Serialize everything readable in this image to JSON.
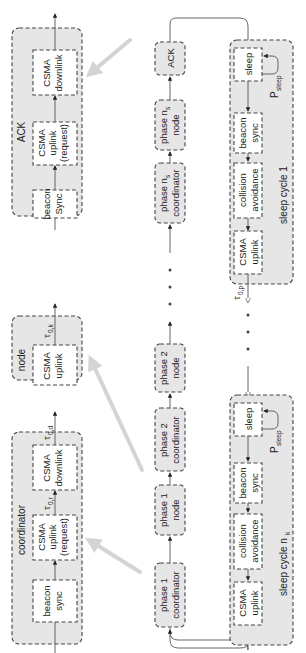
{
  "figure": {
    "orientation": "rotated 90 degrees counter-clockwise",
    "left_column": {
      "ack_detail": {
        "title": "ACK",
        "boxes": [
          {
            "line1": "beacon",
            "line2": "Sync",
            "line3": ""
          },
          {
            "line1": "CSMA",
            "line2": "uplink",
            "line3": "(request)"
          },
          {
            "line1": "CSMA",
            "line2": "downlink",
            "line3": ""
          }
        ]
      },
      "node_detail": {
        "title": "node",
        "boxes": [
          {
            "line1": "CSMA",
            "line2": "uplink"
          }
        ],
        "tau_label": "τ",
        "tau_sub": "0,k"
      },
      "coordinator_detail": {
        "title": "coordinator",
        "boxes": [
          {
            "line1": "beacon",
            "line2": "sync",
            "line3": ""
          },
          {
            "line1": "CSMA",
            "line2": "uplink",
            "line3": "(request)"
          },
          {
            "line1": "CSMA",
            "line2": "downlink",
            "line3": ""
          }
        ],
        "tau_r": "τ",
        "tau_r_sub": "0,r",
        "tau_d": "τ",
        "tau_d_sub": "0,d"
      }
    },
    "middle_column": {
      "phases": [
        {
          "line1": "phase 1",
          "line2": "coordinator"
        },
        {
          "line1": "phase 1",
          "line2": "node"
        },
        {
          "line1": "phase 2",
          "line2": "coordinator"
        },
        {
          "line1": "phase 2",
          "line2": "node"
        },
        {
          "line1": "phase n",
          "line1_sub": "s",
          "line2": "coordinator"
        },
        {
          "line1": "phase n",
          "line1_sub": "s",
          "line2": "node"
        },
        {
          "line1": "ACK",
          "line2": ""
        }
      ],
      "ellipsis": "• • •"
    },
    "right_column": {
      "sleep_cycle_1": {
        "title": "sleep cycle 1",
        "boxes": [
          {
            "line1": "sleep",
            "line2": ""
          },
          {
            "line1": "beacon",
            "line2": "sync"
          },
          {
            "line1": "collision",
            "line2": "avoidance"
          },
          {
            "line1": "CSMA",
            "line2": "uplink"
          }
        ],
        "p_label": "P",
        "p_sub": "sleep",
        "tau_label": "τ",
        "tau_sub": "0,p"
      },
      "sleep_cycle_nk": {
        "title": "sleep cycle n",
        "title_sub": "k",
        "boxes": [
          {
            "line1": "sleep",
            "line2": ""
          },
          {
            "line1": "beacon",
            "line2": "sync"
          },
          {
            "line1": "collision",
            "line2": "avoidance"
          },
          {
            "line1": "CSMA",
            "line2": "uplink"
          }
        ],
        "p_label": "P",
        "p_sub": "sleep"
      },
      "ellipsis": "• • •"
    }
  }
}
